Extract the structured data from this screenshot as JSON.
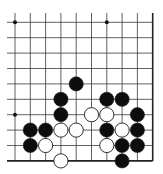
{
  "board": {
    "type": "go-diagram",
    "view": "lower-right corner",
    "columns": 10,
    "rows": 10,
    "origin_x": 15,
    "origin_y": 22.3,
    "spacing_x": 15.3,
    "spacing_y": 15.4,
    "line_color": "#3a3a3a",
    "edge_color": "#222222",
    "background": "#ffffff",
    "star_points": [
      {
        "col": 0,
        "row": 0
      },
      {
        "col": 6,
        "row": 0
      },
      {
        "col": 0,
        "row": 6
      }
    ],
    "stones": [
      {
        "color": "black",
        "col": 4,
        "row": 4
      },
      {
        "color": "black",
        "col": 3,
        "row": 5
      },
      {
        "color": "black",
        "col": 6,
        "row": 5
      },
      {
        "color": "black",
        "col": 7,
        "row": 5
      },
      {
        "color": "black",
        "col": 3,
        "row": 6
      },
      {
        "color": "white",
        "col": 5,
        "row": 6
      },
      {
        "color": "white",
        "col": 6,
        "row": 6
      },
      {
        "color": "black",
        "col": 8,
        "row": 6
      },
      {
        "color": "black",
        "col": 1,
        "row": 7
      },
      {
        "color": "black",
        "col": 2,
        "row": 7
      },
      {
        "color": "white",
        "col": 3,
        "row": 7
      },
      {
        "color": "white",
        "col": 4,
        "row": 7
      },
      {
        "color": "black",
        "col": 6,
        "row": 7
      },
      {
        "color": "white",
        "col": 7,
        "row": 7
      },
      {
        "color": "black",
        "col": 8,
        "row": 7
      },
      {
        "color": "black",
        "col": 1,
        "row": 8
      },
      {
        "color": "white",
        "col": 2,
        "row": 8
      },
      {
        "color": "white",
        "col": 6,
        "row": 8
      },
      {
        "color": "black",
        "col": 7,
        "row": 8
      },
      {
        "color": "black",
        "col": 8,
        "row": 8
      },
      {
        "color": "white",
        "col": 3,
        "row": 9
      },
      {
        "color": "black",
        "col": 7,
        "row": 9
      }
    ]
  }
}
